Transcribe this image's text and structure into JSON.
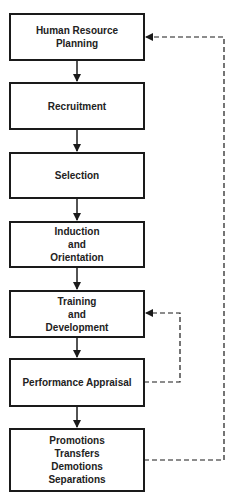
{
  "diagram": {
    "steps": [
      {
        "lines": [
          "Human Resource",
          "Planning"
        ]
      },
      {
        "lines": [
          "Recruitment"
        ]
      },
      {
        "lines": [
          "Selection"
        ]
      },
      {
        "lines": [
          "Induction",
          "and",
          "Orientation"
        ]
      },
      {
        "lines": [
          "Training",
          "and",
          "Development"
        ]
      },
      {
        "lines": [
          "Performance Appraisal"
        ]
      },
      {
        "lines": [
          "Promotions",
          "Transfers",
          "Demotions",
          "Separations"
        ]
      }
    ],
    "feedback_loops": [
      {
        "from": "Performance Appraisal",
        "to": "Training and Development",
        "style": "dashed"
      },
      {
        "from": "Promotions Transfers Demotions Separations",
        "to": "Human Resource Planning",
        "style": "dashed"
      }
    ]
  }
}
